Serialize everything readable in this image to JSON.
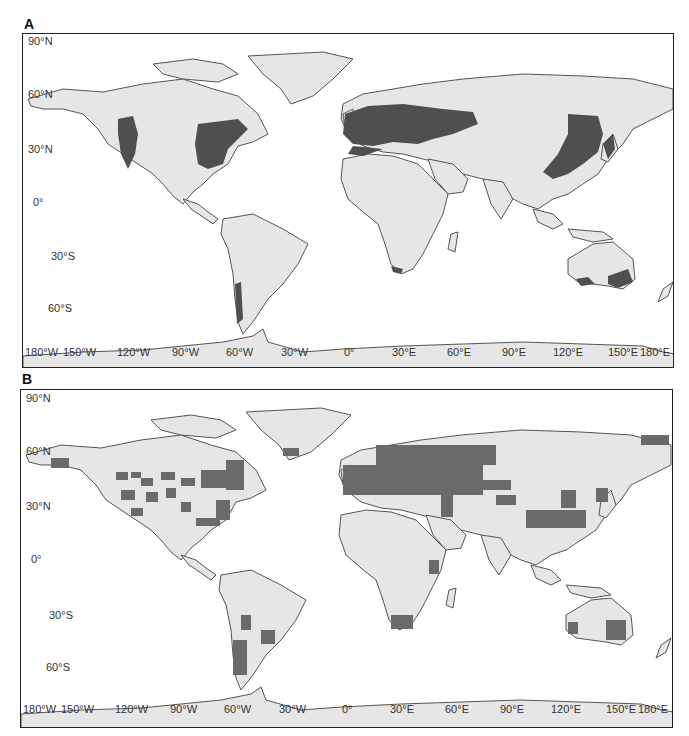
{
  "figure": {
    "panels": [
      {
        "id": "A",
        "label": "A",
        "description": "Observed distribution (dense shading) of temperate forest species",
        "lat_labels": [
          "90°N",
          "60°N",
          "30°N",
          "0°",
          "30°S",
          "60°S"
        ],
        "lon_labels": [
          "180°W",
          "150°W",
          "120°W",
          "90°W",
          "60°W",
          "30°W",
          "0°",
          "30°E",
          "60°E",
          "90°E",
          "120°E",
          "150°E",
          "180°E"
        ]
      },
      {
        "id": "B",
        "label": "B",
        "description": "Gridded (cell-based) distribution",
        "lat_labels": [
          "90°N",
          "60°N",
          "30°N",
          "0°",
          "30°S",
          "60°S"
        ],
        "lon_labels": [
          "180°W",
          "150°W",
          "120°W",
          "90°W",
          "60°W",
          "30°W",
          "0°",
          "30°E",
          "60°E",
          "90°E",
          "120°E",
          "150°E",
          "180°E"
        ]
      }
    ],
    "colors": {
      "land": "#e6e6e6",
      "coast": "#555555",
      "presence": "#5a5a5a",
      "ocean": "#ffffff",
      "frame": "#222222"
    }
  }
}
